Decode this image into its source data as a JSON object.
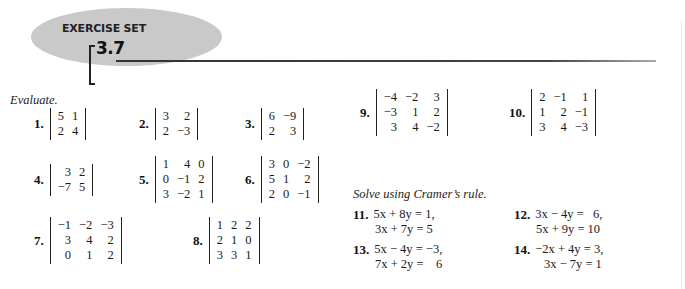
{
  "header": {
    "title": "EXERCISE SET",
    "section_number": "3.7"
  },
  "evaluate": {
    "instruction": "Evaluate.",
    "problems": [
      {
        "number": "1.",
        "matrix": [
          [
            "5",
            "1"
          ],
          [
            "2",
            "4"
          ]
        ]
      },
      {
        "number": "2.",
        "matrix": [
          [
            "3",
            "2"
          ],
          [
            "2",
            "−3"
          ]
        ]
      },
      {
        "number": "3.",
        "matrix": [
          [
            "6",
            "−9"
          ],
          [
            "2",
            "3"
          ]
        ]
      },
      {
        "number": "4.",
        "matrix": [
          [
            "3",
            "2"
          ],
          [
            "−7",
            "5"
          ]
        ]
      },
      {
        "number": "5.",
        "matrix": [
          [
            "1",
            "4",
            "0"
          ],
          [
            "0",
            "−1",
            "2"
          ],
          [
            "3",
            "−2",
            "1"
          ]
        ]
      },
      {
        "number": "6.",
        "matrix": [
          [
            "3",
            "0",
            "−2"
          ],
          [
            "5",
            "1",
            "2"
          ],
          [
            "2",
            "0",
            "−1"
          ]
        ]
      },
      {
        "number": "7.",
        "matrix": [
          [
            "−1",
            "−2",
            "−3"
          ],
          [
            "3",
            "4",
            "2"
          ],
          [
            "0",
            "1",
            "2"
          ]
        ]
      },
      {
        "number": "8.",
        "matrix": [
          [
            "1",
            "2",
            "2"
          ],
          [
            "2",
            "1",
            "0"
          ],
          [
            "3",
            "3",
            "1"
          ]
        ]
      },
      {
        "number": "9.",
        "matrix": [
          [
            "−4",
            "−2",
            "3"
          ],
          [
            "−3",
            "1",
            "2"
          ],
          [
            "3",
            "4",
            "−2"
          ]
        ]
      },
      {
        "number": "10.",
        "matrix": [
          [
            "2",
            "−1",
            "1"
          ],
          [
            "1",
            "2",
            "−1"
          ],
          [
            "3",
            "4",
            "−3"
          ]
        ]
      }
    ]
  },
  "cramer": {
    "instruction": "Solve using Cramer’s rule.",
    "problems": [
      {
        "number": "11.",
        "line1": "5x + 8y = 1,",
        "line2": "3x + 7y = 5"
      },
      {
        "number": "12.",
        "line1": "3x − 4y =   6,",
        "line2": "5x + 9y = 10"
      },
      {
        "number": "13.",
        "line1": "5x − 4y = −3,",
        "line2": "7x + 2y =    6"
      },
      {
        "number": "14.",
        "line1": "−2x + 4y = 3,",
        "line2": "3x − 7y = 1"
      }
    ]
  }
}
